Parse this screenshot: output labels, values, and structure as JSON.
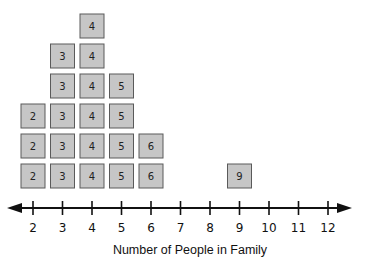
{
  "chart_data": {
    "type": "dot-plot",
    "title": "",
    "xlabel": "Number of People in Family",
    "ylabel": "",
    "xlim": [
      2,
      12
    ],
    "ticks": [
      2,
      3,
      4,
      5,
      6,
      7,
      8,
      9,
      10,
      11,
      12
    ],
    "tick_labels": [
      "2",
      "3",
      "4",
      "5",
      "6",
      "7",
      "8",
      "9",
      "10",
      "11",
      "12"
    ],
    "counts": [
      {
        "value": 2,
        "count": 3
      },
      {
        "value": 3,
        "count": 5
      },
      {
        "value": 4,
        "count": 6
      },
      {
        "value": 5,
        "count": 4
      },
      {
        "value": 6,
        "count": 2
      },
      {
        "value": 9,
        "count": 1
      }
    ],
    "marker": "labeled square",
    "grid": false,
    "axis_arrows": "both"
  }
}
